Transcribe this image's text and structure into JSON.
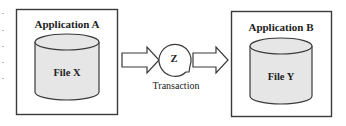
{
  "diagram": {
    "left_app": {
      "title": "Application A",
      "file": "File X"
    },
    "right_app": {
      "title": "Application B",
      "file": "File Y"
    },
    "process": {
      "symbol": "Z",
      "label": "Transaction"
    },
    "arrows": [
      {
        "from": "Application A",
        "to": "Transaction"
      },
      {
        "from": "Transaction",
        "to": "Application B"
      }
    ]
  }
}
